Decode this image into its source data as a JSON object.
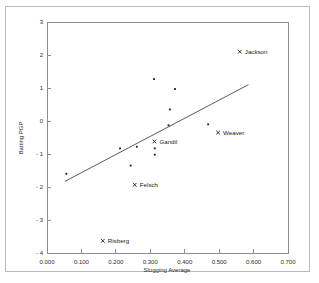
{
  "chart_data": {
    "type": "scatter",
    "title": "",
    "xlabel": "Slugging Average",
    "ylabel": "Batting PGP",
    "xlim": [
      0.0,
      0.7
    ],
    "ylim": [
      -4,
      3
    ],
    "grid": false,
    "legend": null,
    "xticks": [
      "0.000",
      "0.100",
      "0.200",
      "0.300",
      "0.400",
      "0.500",
      "0.600",
      "0.700"
    ],
    "xtick_values": [
      0.0,
      0.1,
      0.2,
      0.3,
      0.4,
      0.5,
      0.6,
      0.7
    ],
    "yticks": [
      "3",
      "2",
      "1",
      "0",
      "- 1",
      "- 2",
      "- 3",
      "- 4"
    ],
    "ytick_values": [
      3,
      2,
      1,
      0,
      -1,
      -2,
      -3,
      -4
    ],
    "marker_color": "#1a1a1a",
    "line_color": "#4a4a4a",
    "axis_color": "#8d8d8d",
    "points": [
      {
        "label": "Jackson",
        "x": 0.56,
        "y": 2.1,
        "labeled": true,
        "label_dx": 5,
        "label_dy": 2.5
      },
      {
        "label": "Weaver",
        "x": 0.497,
        "y": -0.35,
        "labeled": true,
        "label_dx": 5,
        "label_dy": 2.5
      },
      {
        "label": "Gandil",
        "x": 0.312,
        "y": -0.62,
        "labeled": true,
        "label_dx": 5,
        "label_dy": 2.5
      },
      {
        "label": "Felsch",
        "x": 0.255,
        "y": -1.93,
        "labeled": true,
        "label_dx": 5,
        "label_dy": 2.5
      },
      {
        "label": "Risberg",
        "x": 0.162,
        "y": -3.63,
        "labeled": true,
        "label_dx": 5,
        "label_dy": 2.5
      },
      {
        "label": "",
        "x": 0.056,
        "y": -1.6,
        "labeled": false
      },
      {
        "label": "",
        "x": 0.212,
        "y": -0.83,
        "labeled": false
      },
      {
        "label": "",
        "x": 0.243,
        "y": -1.35,
        "labeled": false
      },
      {
        "label": "",
        "x": 0.261,
        "y": -0.78,
        "labeled": false
      },
      {
        "label": "",
        "x": 0.311,
        "y": 1.27,
        "labeled": false
      },
      {
        "label": "",
        "x": 0.313,
        "y": -0.83,
        "labeled": false
      },
      {
        "label": "",
        "x": 0.313,
        "y": -1.02,
        "labeled": false
      },
      {
        "label": "",
        "x": 0.353,
        "y": -0.13,
        "labeled": false
      },
      {
        "label": "",
        "x": 0.357,
        "y": 0.35,
        "labeled": false
      },
      {
        "label": "",
        "x": 0.372,
        "y": 0.97,
        "labeled": false
      },
      {
        "label": "",
        "x": 0.468,
        "y": -0.1,
        "labeled": false
      }
    ],
    "fit_line": {
      "x0": 0.052,
      "y0": -1.83,
      "x1": 0.585,
      "y1": 1.1
    }
  }
}
